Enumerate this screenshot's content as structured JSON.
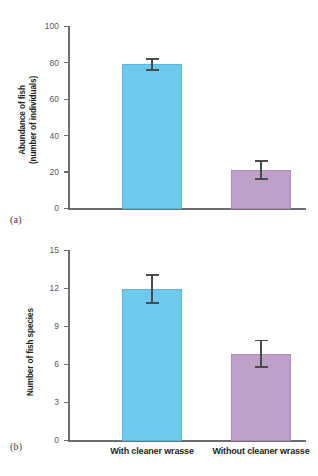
{
  "figure": {
    "panels": [
      {
        "letter": "(a)",
        "ylabel_line1": "Abundance of fish",
        "ylabel_line2": "(number of individuals)",
        "ticks": [
          "0",
          "20",
          "40",
          "60",
          "80",
          "100"
        ]
      },
      {
        "letter": "(b)",
        "ylabel_line1": "Number of fish species",
        "ylabel_line2": "",
        "ticks": [
          "0",
          "3",
          "6",
          "9",
          "12",
          "15"
        ]
      }
    ],
    "categories": [
      "With cleaner wrasse",
      "Without cleaner wrasse"
    ],
    "colors": {
      "blue": "#6fc9ee",
      "purple": "#bfa0c8",
      "axis": "#6d6e71",
      "error": "#4b4b4d",
      "text": "#231f20"
    }
  },
  "chart_data": [
    {
      "type": "bar",
      "title": "",
      "panel": "(a)",
      "categories": [
        "With cleaner wrasse",
        "Without cleaner wrasse"
      ],
      "values": [
        79.5,
        21.5
      ],
      "errors": [
        3.5,
        5.5
      ],
      "colors": [
        "#6fc9ee",
        "#bfa0c8"
      ],
      "xlabel": "",
      "ylabel": "Abundance of fish (number of individuals)",
      "ylim": [
        0,
        100
      ],
      "yticks": [
        0,
        20,
        40,
        60,
        80,
        100
      ],
      "grid": false,
      "legend": "none"
    },
    {
      "type": "bar",
      "title": "",
      "panel": "(b)",
      "categories": [
        "With cleaner wrasse",
        "Without cleaner wrasse"
      ],
      "values": [
        12.0,
        6.9
      ],
      "errors": [
        1.2,
        1.1
      ],
      "colors": [
        "#6fc9ee",
        "#bfa0c8"
      ],
      "xlabel": "",
      "ylabel": "Number of fish species",
      "ylim": [
        0,
        15
      ],
      "yticks": [
        0,
        3,
        6,
        9,
        12,
        15
      ],
      "grid": false,
      "legend": "none"
    }
  ]
}
